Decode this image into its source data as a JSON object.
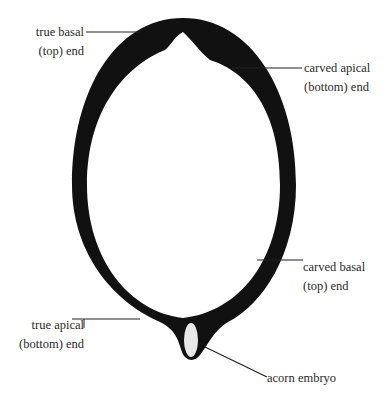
{
  "diagram": {
    "type": "acorn cross-section (labeled)",
    "colors": {
      "shell": "#111111",
      "embryo": "#e8e8e8",
      "leader": "#222222",
      "text": "#2a2a2a"
    },
    "labels": {
      "true_basal": {
        "line1": "true basal",
        "line2": "(top) end"
      },
      "carved_apical": {
        "line1": "carved apical",
        "line2": "(bottom) end"
      },
      "carved_basal": {
        "line1": "carved basal",
        "line2": "(top) end"
      },
      "true_apical": {
        "line1": "true apical",
        "line2": "(bottom) end"
      },
      "embryo": {
        "line1": "acorn embryo"
      }
    }
  }
}
